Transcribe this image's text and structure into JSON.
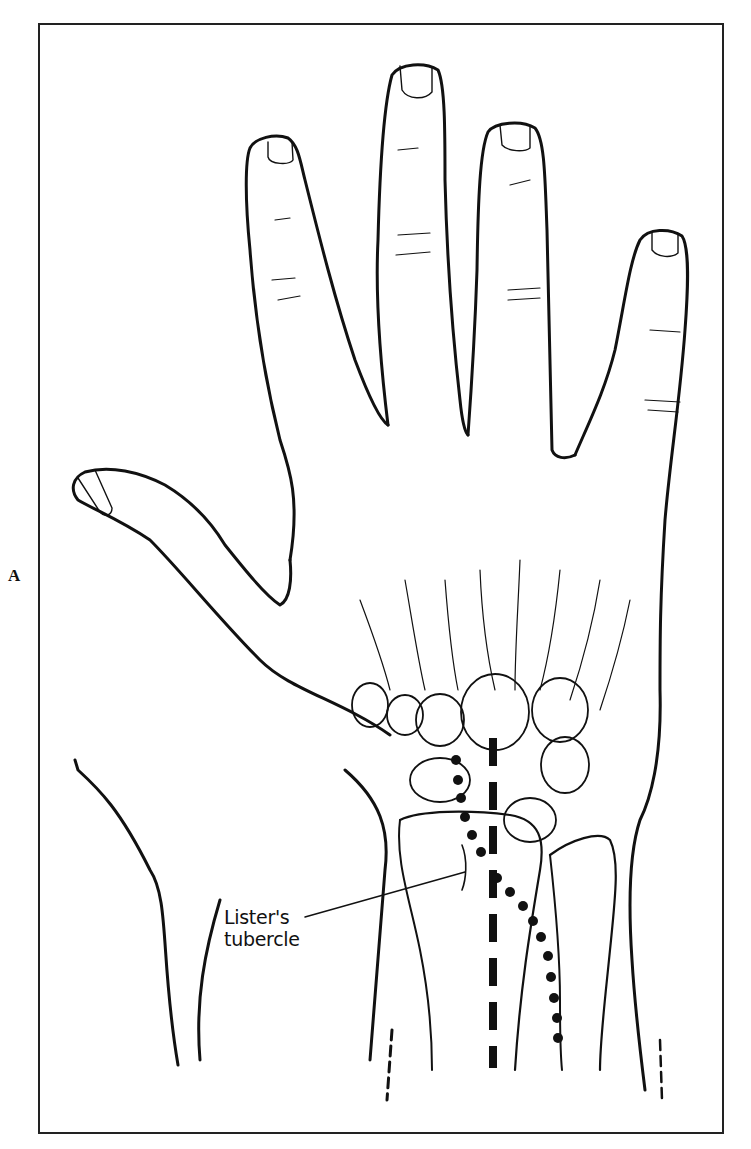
{
  "figure": {
    "panel_letter": "A",
    "labels": [
      {
        "id": "listers-tubercle",
        "line1": "Lister's",
        "line2": "tubercle"
      }
    ],
    "overlays": [
      {
        "type": "dashed-line",
        "description": "vertical heavy dashed line along third metacarpal/capitate axis"
      },
      {
        "type": "dotted-line",
        "description": "curved dotted line from scaphoid-lunate region past Lister's tubercle toward ulnar side of radius"
      }
    ],
    "colors": {
      "ink": "#111111",
      "background": "#ffffff"
    }
  }
}
